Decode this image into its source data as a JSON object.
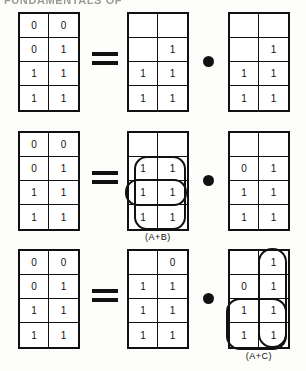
{
  "page": {
    "top_heading": "FUNDAMENTALS OF",
    "background_color": "#fdfdfb",
    "ink_color": "#111111"
  },
  "operators": {
    "equals": "=",
    "and_dot": "•"
  },
  "equations": [
    {
      "id": "equation-1",
      "left_map": {
        "name": "result-map",
        "cells": [
          "0",
          "0",
          "0",
          "1",
          "1",
          "1",
          "1",
          "1"
        ]
      },
      "first_operand_map": {
        "name": "operand-map-1",
        "cells": [
          "",
          "",
          "",
          "1",
          "1",
          "1",
          "1",
          "1"
        ],
        "loops": [],
        "label": ""
      },
      "second_operand_map": {
        "name": "operand-map-2",
        "cells": [
          "",
          "",
          "",
          "1",
          "1",
          "1",
          "1",
          "1"
        ],
        "loops": [],
        "label": ""
      }
    },
    {
      "id": "equation-2",
      "left_map": {
        "name": "result-map",
        "cells": [
          "0",
          "0",
          "0",
          "1",
          "1",
          "1",
          "1",
          "1"
        ]
      },
      "first_operand_map": {
        "name": "operand-map-1",
        "cells": [
          "",
          "",
          "1",
          "1",
          "1",
          "1",
          "1",
          "1"
        ],
        "loops": [
          "group-vertical",
          "group-horizontal"
        ],
        "label": "(A+B)"
      },
      "second_operand_map": {
        "name": "operand-map-2",
        "cells": [
          "",
          "",
          "0",
          "1",
          "1",
          "1",
          "1",
          "1"
        ],
        "loops": [],
        "label": ""
      }
    },
    {
      "id": "equation-3",
      "left_map": {
        "name": "result-map",
        "cells": [
          "0",
          "0",
          "0",
          "1",
          "1",
          "1",
          "1",
          "1"
        ]
      },
      "first_operand_map": {
        "name": "operand-map-1",
        "cells": [
          "",
          "0",
          "1",
          "1",
          "1",
          "1",
          "1",
          "1"
        ],
        "loops": [],
        "label": ""
      },
      "second_operand_map": {
        "name": "operand-map-2",
        "cells": [
          "",
          "1",
          "0",
          "1",
          "1",
          "1",
          "1",
          "1"
        ],
        "loops": [
          "group-vertical",
          "group-horizontal"
        ],
        "label": "(A+C)"
      }
    }
  ]
}
